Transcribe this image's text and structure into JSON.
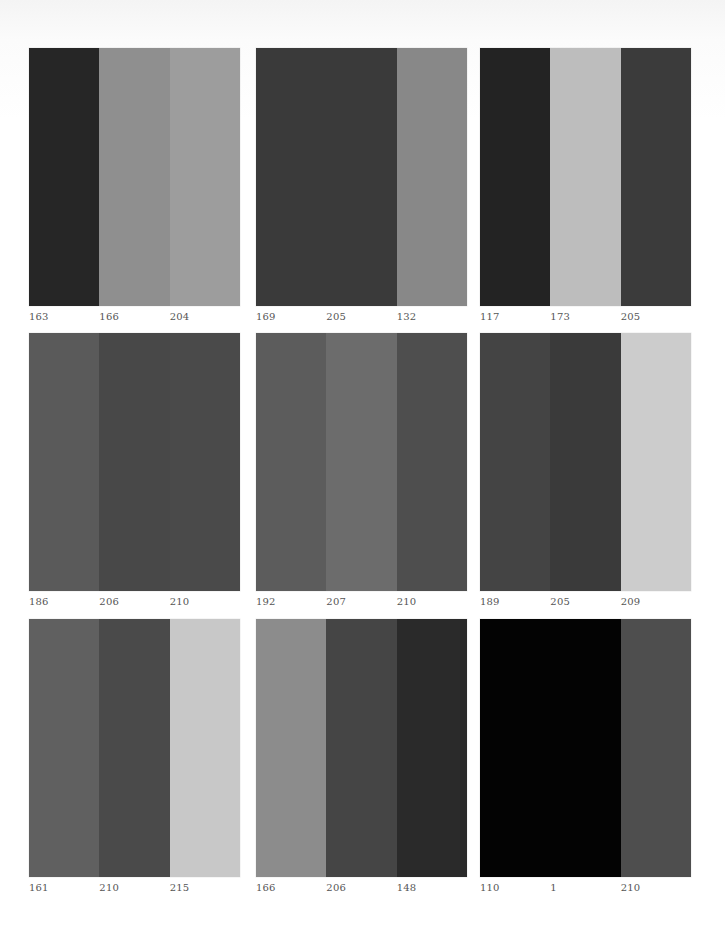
{
  "panels": [
    {
      "values": [
        "163",
        "166",
        "204"
      ],
      "colors": [
        "#262626",
        "#8f8f8f",
        "#9d9d9d"
      ]
    },
    {
      "values": [
        "169",
        "205",
        "132"
      ],
      "colors": [
        "#3a3a3a",
        "#3a3a3a",
        "#888888"
      ]
    },
    {
      "values": [
        "117",
        "173",
        "205"
      ],
      "colors": [
        "#232323",
        "#bdbdbd",
        "#3b3b3b"
      ]
    },
    {
      "values": [
        "186",
        "206",
        "210"
      ],
      "colors": [
        "#5a5a5a",
        "#484848",
        "#4a4a4a"
      ]
    },
    {
      "values": [
        "192",
        "207",
        "210"
      ],
      "colors": [
        "#5c5c5c",
        "#6c6c6c",
        "#4e4e4e"
      ]
    },
    {
      "values": [
        "189",
        "205",
        "209"
      ],
      "colors": [
        "#444444",
        "#3a3a3a",
        "#cccccc"
      ]
    },
    {
      "values": [
        "161",
        "210",
        "215"
      ],
      "colors": [
        "#606060",
        "#4a4a4a",
        "#c8c8c8"
      ]
    },
    {
      "values": [
        "166",
        "206",
        "148"
      ],
      "colors": [
        "#8c8c8c",
        "#454545",
        "#2a2a2a"
      ]
    },
    {
      "values": [
        "110",
        "1",
        "210"
      ],
      "colors": [
        "#030303",
        "#030303",
        "#4e4e4e"
      ]
    }
  ],
  "layout": {
    "columns_x": [
      29,
      256,
      480
    ],
    "rows_y": [
      48,
      333,
      619
    ]
  }
}
